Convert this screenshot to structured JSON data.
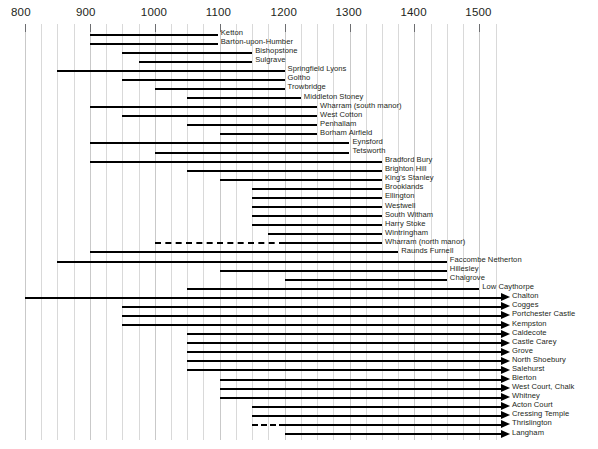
{
  "chart_data": {
    "type": "bar",
    "title": "",
    "xlabel": "",
    "ylabel": "",
    "orientation": "horizontal",
    "grid": true,
    "legend": false,
    "xlim": [
      780,
      1540
    ],
    "axis": {
      "major_ticks": [
        800,
        900,
        1000,
        1100,
        1200,
        1300,
        1400,
        1500
      ],
      "tick_labels": [
        "800",
        "900",
        "1000",
        "1100",
        "1200",
        "1300",
        "1400",
        "1500"
      ],
      "minor_tick_interval": 25,
      "units": "years AD"
    },
    "note": "Horizontal date-range bars for excavated medieval settlement sites; arrowheads mean the range continues beyond the right edge of the plot; dashed segments indicate uncertain/intermittent phases",
    "series": [
      {
        "label": "Ketton",
        "start": 900,
        "end": 1097,
        "dashed_start": null,
        "dashed_end": null,
        "arrow": false
      },
      {
        "label": "Barton-upon-Humber",
        "start": 900,
        "end": 1097,
        "dashed_start": null,
        "dashed_end": null,
        "arrow": false
      },
      {
        "label": "Bishopstone",
        "start": 950,
        "end": 1150,
        "dashed_start": null,
        "dashed_end": null,
        "arrow": false
      },
      {
        "label": "Sulgrave",
        "start": 975,
        "end": 1150,
        "dashed_start": null,
        "dashed_end": null,
        "arrow": false
      },
      {
        "label": "Springfield Lyons",
        "start": 850,
        "end": 1200,
        "dashed_start": null,
        "dashed_end": null,
        "arrow": false
      },
      {
        "label": "Goltho",
        "start": 950,
        "end": 1200,
        "dashed_start": null,
        "dashed_end": null,
        "arrow": false
      },
      {
        "label": "Trowbridge",
        "start": 1000,
        "end": 1200,
        "dashed_start": null,
        "dashed_end": null,
        "arrow": false
      },
      {
        "label": "Middleton Stoney",
        "start": 1050,
        "end": 1225,
        "dashed_start": null,
        "dashed_end": null,
        "arrow": false
      },
      {
        "label": "Wharram (south manor)",
        "start": 900,
        "end": 1250,
        "dashed_start": null,
        "dashed_end": null,
        "arrow": false
      },
      {
        "label": "West Cotton",
        "start": 950,
        "end": 1250,
        "dashed_start": null,
        "dashed_end": null,
        "arrow": false
      },
      {
        "label": "Penhallam",
        "start": 1050,
        "end": 1250,
        "dashed_start": null,
        "dashed_end": null,
        "arrow": false
      },
      {
        "label": "Borham Airfield",
        "start": 1100,
        "end": 1250,
        "dashed_start": null,
        "dashed_end": null,
        "arrow": false
      },
      {
        "label": "Eynsford",
        "start": 900,
        "end": 1300,
        "dashed_start": null,
        "dashed_end": null,
        "arrow": false
      },
      {
        "label": "Tetsworth",
        "start": 1000,
        "end": 1300,
        "dashed_start": null,
        "dashed_end": null,
        "arrow": false
      },
      {
        "label": "Bradford Bury",
        "start": 900,
        "end": 1350,
        "dashed_start": null,
        "dashed_end": null,
        "arrow": false
      },
      {
        "label": "Brighton Hill",
        "start": 1050,
        "end": 1350,
        "dashed_start": null,
        "dashed_end": null,
        "arrow": false
      },
      {
        "label": "King's Stanley",
        "start": 1100,
        "end": 1350,
        "dashed_start": null,
        "dashed_end": null,
        "arrow": false
      },
      {
        "label": "Brooklands",
        "start": 1150,
        "end": 1350,
        "dashed_start": null,
        "dashed_end": null,
        "arrow": false
      },
      {
        "label": "Ellington",
        "start": 1150,
        "end": 1350,
        "dashed_start": null,
        "dashed_end": null,
        "arrow": false
      },
      {
        "label": "Westwell",
        "start": 1150,
        "end": 1350,
        "dashed_start": null,
        "dashed_end": null,
        "arrow": false
      },
      {
        "label": "South Witham",
        "start": 1150,
        "end": 1350,
        "dashed_start": null,
        "dashed_end": null,
        "arrow": false
      },
      {
        "label": "Harry Stoke",
        "start": 1150,
        "end": 1350,
        "dashed_start": null,
        "dashed_end": null,
        "arrow": false
      },
      {
        "label": "Wintringham",
        "start": 1175,
        "end": 1350,
        "dashed_start": null,
        "dashed_end": null,
        "arrow": false
      },
      {
        "label": "Wharram (north manor)",
        "start": 1200,
        "end": 1350,
        "dashed_start": 1000,
        "dashed_end": 1200,
        "arrow": false
      },
      {
        "label": "Raunds Furnell",
        "start": 900,
        "end": 1375,
        "dashed_start": null,
        "dashed_end": null,
        "arrow": false
      },
      {
        "label": "Faccombe Netherton",
        "start": 850,
        "end": 1450,
        "dashed_start": null,
        "dashed_end": null,
        "arrow": false
      },
      {
        "label": "Hillesley",
        "start": 1100,
        "end": 1450,
        "dashed_start": null,
        "dashed_end": null,
        "arrow": false
      },
      {
        "label": "Chalgrove",
        "start": 1200,
        "end": 1450,
        "dashed_start": null,
        "dashed_end": null,
        "arrow": false
      },
      {
        "label": "Low Caythorpe",
        "start": 1050,
        "end": 1500,
        "dashed_start": null,
        "dashed_end": null,
        "arrow": false
      },
      {
        "label": "Chalton",
        "start": 800,
        "end": 1540,
        "dashed_start": null,
        "dashed_end": null,
        "arrow": true
      },
      {
        "label": "Cogges",
        "start": 950,
        "end": 1540,
        "dashed_start": null,
        "dashed_end": null,
        "arrow": true
      },
      {
        "label": "Portchester Castle",
        "start": 950,
        "end": 1540,
        "dashed_start": null,
        "dashed_end": null,
        "arrow": true
      },
      {
        "label": "Kempston",
        "start": 950,
        "end": 1540,
        "dashed_start": null,
        "dashed_end": null,
        "arrow": true
      },
      {
        "label": "Caldecote",
        "start": 1050,
        "end": 1540,
        "dashed_start": null,
        "dashed_end": null,
        "arrow": true
      },
      {
        "label": "Castle Carey",
        "start": 1050,
        "end": 1540,
        "dashed_start": null,
        "dashed_end": null,
        "arrow": true
      },
      {
        "label": "Grove",
        "start": 1050,
        "end": 1540,
        "dashed_start": null,
        "dashed_end": null,
        "arrow": true
      },
      {
        "label": "North Shoebury",
        "start": 1050,
        "end": 1540,
        "dashed_start": null,
        "dashed_end": null,
        "arrow": true
      },
      {
        "label": "Salehurst",
        "start": 1050,
        "end": 1540,
        "dashed_start": null,
        "dashed_end": null,
        "arrow": true
      },
      {
        "label": "Bierton",
        "start": 1100,
        "end": 1540,
        "dashed_start": null,
        "dashed_end": null,
        "arrow": true
      },
      {
        "label": "West Court, Chalk",
        "start": 1100,
        "end": 1540,
        "dashed_start": null,
        "dashed_end": null,
        "arrow": true
      },
      {
        "label": "Whitney",
        "start": 1100,
        "end": 1540,
        "dashed_start": null,
        "dashed_end": null,
        "arrow": true
      },
      {
        "label": "Acton Court",
        "start": 1150,
        "end": 1540,
        "dashed_start": null,
        "dashed_end": null,
        "arrow": true
      },
      {
        "label": "Cressing Temple",
        "start": 1150,
        "end": 1540,
        "dashed_start": null,
        "dashed_end": null,
        "arrow": true
      },
      {
        "label": "Thrislington",
        "start": 1200,
        "end": 1540,
        "dashed_start": 1150,
        "dashed_end": 1200,
        "arrow": true
      },
      {
        "label": "Langham",
        "start": 1200,
        "end": 1540,
        "dashed_start": null,
        "dashed_end": null,
        "arrow": true
      }
    ]
  }
}
